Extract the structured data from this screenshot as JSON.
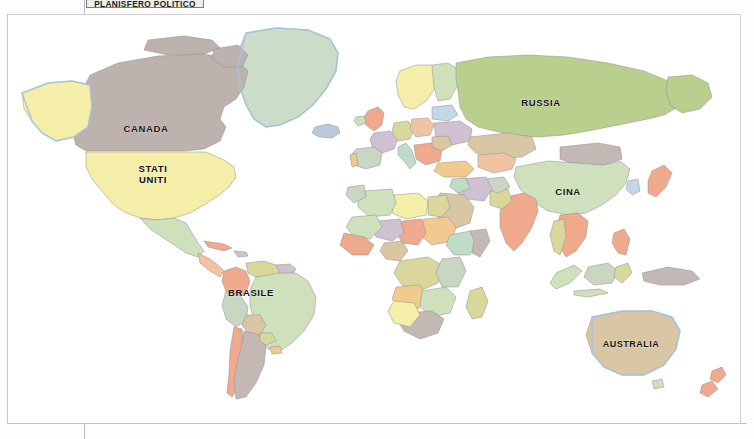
{
  "page": {
    "kind": "atlas-page-scan",
    "background_color": "#fdfdfd",
    "frame_color": "#cfcfcf"
  },
  "title_plate": {
    "text": "PLANISFERO POLITICO",
    "border_color": "#7d7d7d",
    "background_color": "#eeeeec",
    "note": "cropped at top edge of image"
  },
  "map": {
    "projection_look": "rectangular-world",
    "ocean_color": "#ffffff",
    "coastline_color": "#9fc6dd",
    "border_color": "#8f8f8f",
    "labels": [
      {
        "id": "canada",
        "text": "CANADA",
        "x": 138,
        "y": 117,
        "size": "lg"
      },
      {
        "id": "stati-uniti-1",
        "text": "STATI",
        "x": 145,
        "y": 157,
        "size": "lg"
      },
      {
        "id": "stati-uniti-2",
        "text": "UNITI",
        "x": 145,
        "y": 168,
        "size": "lg"
      },
      {
        "id": "brasile",
        "text": "BRASILE",
        "x": 243,
        "y": 281,
        "size": "lg"
      },
      {
        "id": "russia",
        "text": "RUSSIA",
        "x": 533,
        "y": 91,
        "size": "lg"
      },
      {
        "id": "cina",
        "text": "CINA",
        "x": 560,
        "y": 180,
        "size": "lg"
      },
      {
        "id": "australia",
        "text": "AUSTRALIA",
        "x": 623,
        "y": 332,
        "size": "md"
      }
    ],
    "palette": {
      "pale_yellow": "#f4eea8",
      "mauve_gray": "#bdb2ae",
      "pale_green": "#cfe0bd",
      "olive_green": "#b9cf8e",
      "sage": "#c8d6c2",
      "salmon": "#efa98d",
      "peach": "#f0c3a3",
      "tan": "#d9c6a4",
      "mint": "#bedcc6",
      "lilac": "#cfc0d2",
      "pale_blue": "#c3d8e6",
      "light_orange": "#f2c98f",
      "khaki": "#d9d79a",
      "rose": "#e7b9b4",
      "grey_green": "#c4cdb4"
    }
  }
}
